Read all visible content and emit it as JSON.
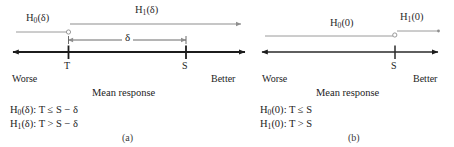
{
  "figure": {
    "caption_a": "(a)",
    "caption_b": "(b)"
  },
  "panel_a": {
    "name": "noninferiority-margin-delta",
    "axis": {
      "left_label": "Worse",
      "right_label": "Better",
      "axis_title": "Mean response",
      "ticks": [
        {
          "label": "T",
          "x": 68
        },
        {
          "label": "S",
          "x": 186
        }
      ],
      "x_start": 11,
      "x_end": 247
    },
    "region_h0": {
      "label": "H0(δ)",
      "label_base": "H",
      "label_sub": "0",
      "label_arg": "(δ)",
      "x_start": 16,
      "x_end": 68,
      "endpoint": "open-circle"
    },
    "region_h1": {
      "label": "H1(δ)",
      "label_base": "H",
      "label_sub": "1",
      "label_arg": "(δ)",
      "x_start": 68,
      "x_end": 243,
      "endpoint": "arrow"
    },
    "margin_arrow": {
      "label": "δ",
      "x_start": 68,
      "x_end": 186
    },
    "hypotheses": [
      {
        "base": "H",
        "sub": "0",
        "arg": "(δ)",
        "rest": ": T ≤ S − δ"
      },
      {
        "base": "H",
        "sub": "1",
        "arg": "(δ)",
        "rest": ": T > S − δ"
      }
    ]
  },
  "panel_b": {
    "name": "superiority-margin-zero",
    "axis": {
      "left_label": "Worse",
      "right_label": "Better",
      "axis_title": "Mean response",
      "ticks": [
        {
          "label": "S",
          "x": 145
        }
      ],
      "x_start": 10,
      "x_end": 190
    },
    "region_h0": {
      "label": "H0(0)",
      "label_base": "H",
      "label_sub": "0",
      "label_arg": "(0)",
      "x_start": 15,
      "x_end": 145,
      "endpoint": "open-circle"
    },
    "region_h1": {
      "label": "H1(0)",
      "label_base": "H",
      "label_sub": "1",
      "label_arg": "(0)",
      "x_start": 145,
      "x_end": 187,
      "endpoint": "plain"
    },
    "hypotheses": [
      {
        "base": "H",
        "sub": "0",
        "arg": "(0)",
        "rest": ": T ≤ S"
      },
      {
        "base": "H",
        "sub": "1",
        "arg": "(0)",
        "rest": ": T > S"
      }
    ]
  },
  "colors": {
    "axis": "#1c1c1c",
    "thin_line": "#8e8e8e",
    "text": "#232323",
    "caption": "#3a3a3a"
  }
}
